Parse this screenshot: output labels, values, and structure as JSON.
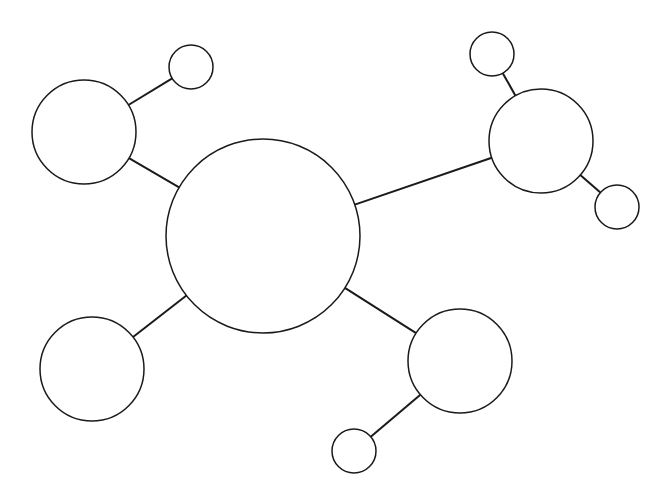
{
  "diagram": {
    "type": "bubble-map",
    "background": "#ffffff",
    "stroke_color": "#1a1a1a",
    "nodes": [
      {
        "id": "center",
        "cx": 263,
        "cy": 236,
        "r": 97,
        "label": ""
      },
      {
        "id": "top-left",
        "cx": 84,
        "cy": 132,
        "r": 52,
        "label": ""
      },
      {
        "id": "top-left-child",
        "cx": 191,
        "cy": 67,
        "r": 22,
        "label": ""
      },
      {
        "id": "right",
        "cx": 541,
        "cy": 141,
        "r": 52,
        "label": ""
      },
      {
        "id": "right-child-top",
        "cx": 492,
        "cy": 54,
        "r": 22,
        "label": ""
      },
      {
        "id": "right-child-bottom",
        "cx": 617,
        "cy": 207,
        "r": 22,
        "label": ""
      },
      {
        "id": "bottom-left",
        "cx": 92,
        "cy": 369,
        "r": 52,
        "label": ""
      },
      {
        "id": "bottom-right",
        "cx": 460,
        "cy": 361,
        "r": 52,
        "label": ""
      },
      {
        "id": "bottom-right-child",
        "cx": 354,
        "cy": 451,
        "r": 22,
        "label": ""
      }
    ],
    "edges": [
      {
        "from": "center",
        "to": "top-left"
      },
      {
        "from": "top-left",
        "to": "top-left-child"
      },
      {
        "from": "center",
        "to": "right"
      },
      {
        "from": "right",
        "to": "right-child-top"
      },
      {
        "from": "right",
        "to": "right-child-bottom"
      },
      {
        "from": "center",
        "to": "bottom-left"
      },
      {
        "from": "center",
        "to": "bottom-right"
      },
      {
        "from": "bottom-right",
        "to": "bottom-right-child"
      }
    ]
  }
}
